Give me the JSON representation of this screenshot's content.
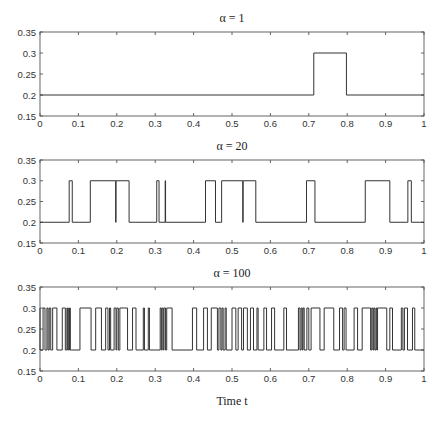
{
  "chart_data": [
    {
      "type": "line",
      "title": "α = 1",
      "xlabel": "",
      "ylabel": "",
      "xlim": [
        0,
        1
      ],
      "ylim": [
        0.15,
        0.35
      ],
      "xticks": [
        "0",
        "0.1",
        "0.2",
        "0.3",
        "0.4",
        "0.5",
        "0.6",
        "0.7",
        "0.8",
        "0.9",
        "1"
      ],
      "yticks": [
        "0.15",
        "0.2",
        "0.25",
        "0.3",
        "0.35"
      ],
      "grid": false,
      "step": true,
      "low": 0.2,
      "high": 0.3,
      "transitions": [
        0.713,
        0.798
      ]
    },
    {
      "type": "line",
      "title": "α = 20",
      "xlabel": "",
      "ylabel": "",
      "xlim": [
        0,
        1
      ],
      "ylim": [
        0.15,
        0.35
      ],
      "xticks": [
        "0",
        "0.1",
        "0.2",
        "0.3",
        "0.4",
        "0.5",
        "0.6",
        "0.7",
        "0.8",
        "0.9",
        "1"
      ],
      "yticks": [
        "0.15",
        "0.2",
        "0.25",
        "0.3",
        "0.35"
      ],
      "grid": false,
      "step": true,
      "low": 0.2,
      "high": 0.3,
      "transitions": [
        0.076,
        0.084,
        0.131,
        0.197,
        0.198,
        0.232,
        0.304,
        0.31,
        0.326,
        0.327,
        0.431,
        0.457,
        0.473,
        0.528,
        0.529,
        0.562,
        0.694,
        0.716,
        0.847,
        0.911,
        0.958,
        0.967
      ]
    },
    {
      "type": "line",
      "title": "α = 100",
      "xlabel": "Time t",
      "ylabel": "",
      "xlim": [
        0,
        1
      ],
      "ylim": [
        0.15,
        0.35
      ],
      "xticks": [
        "0",
        "0.1",
        "0.2",
        "0.3",
        "0.4",
        "0.5",
        "0.6",
        "0.7",
        "0.8",
        "0.9",
        "1"
      ],
      "yticks": [
        "0.15",
        "0.2",
        "0.25",
        "0.3",
        "0.35"
      ],
      "grid": false,
      "step": true,
      "low": 0.2,
      "high": 0.3,
      "start_high": true,
      "transitions": [
        0.0,
        0.008,
        0.013,
        0.018,
        0.021,
        0.024,
        0.028,
        0.033,
        0.044,
        0.058,
        0.066,
        0.07,
        0.072,
        0.075,
        0.076,
        0.077,
        0.079,
        0.104,
        0.133,
        0.145,
        0.16,
        0.171,
        0.177,
        0.181,
        0.184,
        0.193,
        0.198,
        0.2,
        0.204,
        0.208,
        0.228,
        0.241,
        0.25,
        0.269,
        0.272,
        0.282,
        0.285,
        0.313,
        0.316,
        0.318,
        0.321,
        0.323,
        0.327,
        0.33,
        0.344,
        0.397,
        0.408,
        0.426,
        0.436,
        0.446,
        0.462,
        0.466,
        0.471,
        0.474,
        0.477,
        0.482,
        0.485,
        0.5,
        0.51,
        0.516,
        0.525,
        0.53,
        0.54,
        0.548,
        0.556,
        0.565,
        0.568,
        0.583,
        0.59,
        0.603,
        0.611,
        0.635,
        0.642,
        0.673,
        0.677,
        0.68,
        0.683,
        0.685,
        0.688,
        0.695,
        0.7,
        0.706,
        0.729,
        0.74,
        0.765,
        0.78,
        0.788,
        0.792,
        0.797,
        0.818,
        0.827,
        0.839,
        0.861,
        0.864,
        0.867,
        0.869,
        0.872,
        0.875,
        0.877,
        0.879,
        0.903,
        0.911,
        0.918,
        0.941,
        0.945,
        0.949,
        0.957,
        0.97,
        0.976
      ]
    }
  ],
  "figure": {
    "xlabel": "Time t"
  }
}
